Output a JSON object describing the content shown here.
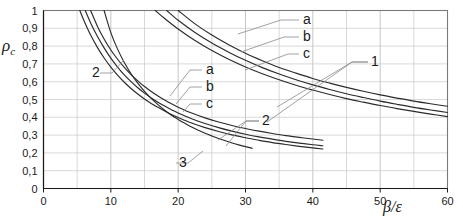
{
  "chart_data": {
    "type": "line",
    "title": "",
    "xlabel": "β/ε",
    "ylabel": "ρ",
    "ylabel_sub": "c",
    "xlim": [
      0,
      60
    ],
    "ylim": [
      0,
      1
    ],
    "grid": true,
    "x_major_step": 10,
    "x_minor_step": 5,
    "y_major_step": 0.1,
    "legend_position": "inline-callouts",
    "xticks": [
      "0",
      "10",
      "20",
      "30",
      "40",
      "50",
      "60"
    ],
    "xtick_values": [
      0,
      10,
      20,
      30,
      40,
      50,
      60
    ],
    "yticks": [
      "0",
      "0,1",
      "0,2",
      "0,3",
      "0,4",
      "0,5",
      "0,6",
      "0,7",
      "0,8",
      "0,9",
      "1"
    ],
    "ytick_values": [
      0,
      0.1,
      0.2,
      0.3,
      0.4,
      0.5,
      0.6,
      0.7,
      0.8,
      0.9,
      1
    ],
    "annotations": [
      {
        "text": "a",
        "x_px": 303,
        "y_px": 24,
        "group": "1"
      },
      {
        "text": "b",
        "x_px": 303,
        "y_px": 41,
        "group": "1"
      },
      {
        "text": "c",
        "x_px": 303,
        "y_px": 58,
        "group": "1"
      },
      {
        "text": "1",
        "x_px": 371,
        "y_px": 66,
        "group": "1"
      },
      {
        "text": "a",
        "x_px": 206,
        "y_px": 74,
        "group": "2"
      },
      {
        "text": "b",
        "x_px": 206,
        "y_px": 91,
        "group": "2"
      },
      {
        "text": "c",
        "x_px": 206,
        "y_px": 108,
        "group": "2"
      },
      {
        "text": "2",
        "x_px": 262,
        "y_px": 125,
        "group": "2"
      },
      {
        "text": "2",
        "x_px": 92,
        "y_px": 77,
        "group": "2"
      },
      {
        "text": "3",
        "x_px": 179,
        "y_px": 167,
        "group": "3"
      }
    ],
    "series": [
      {
        "name": "1a",
        "group": "1",
        "points": [
          [
            20.0,
            1.0
          ],
          [
            22.5,
            0.925
          ],
          [
            25.0,
            0.862
          ],
          [
            27.5,
            0.808
          ],
          [
            30.0,
            0.76
          ],
          [
            32.5,
            0.718
          ],
          [
            35.0,
            0.68
          ],
          [
            37.5,
            0.648
          ],
          [
            40.0,
            0.618
          ],
          [
            42.5,
            0.592
          ],
          [
            45.0,
            0.568
          ],
          [
            47.5,
            0.546
          ],
          [
            50.0,
            0.526
          ],
          [
            52.5,
            0.508
          ],
          [
            55.0,
            0.491
          ],
          [
            57.5,
            0.476
          ],
          [
            60.0,
            0.462
          ]
        ]
      },
      {
        "name": "1b",
        "group": "1",
        "points": [
          [
            18.3,
            1.0
          ],
          [
            20.0,
            0.945
          ],
          [
            22.5,
            0.876
          ],
          [
            25.0,
            0.817
          ],
          [
            27.5,
            0.766
          ],
          [
            30.0,
            0.72
          ],
          [
            32.5,
            0.679
          ],
          [
            35.0,
            0.643
          ],
          [
            37.5,
            0.611
          ],
          [
            40.0,
            0.582
          ],
          [
            42.5,
            0.556
          ],
          [
            45.0,
            0.532
          ],
          [
            47.5,
            0.511
          ],
          [
            50.0,
            0.491
          ],
          [
            52.5,
            0.473
          ],
          [
            55.0,
            0.456
          ],
          [
            57.5,
            0.441
          ],
          [
            60.0,
            0.427
          ]
        ]
      },
      {
        "name": "1c",
        "group": "1",
        "points": [
          [
            16.6,
            1.0
          ],
          [
            18.0,
            0.955
          ],
          [
            20.0,
            0.896
          ],
          [
            22.5,
            0.831
          ],
          [
            25.0,
            0.775
          ],
          [
            27.5,
            0.726
          ],
          [
            30.0,
            0.683
          ],
          [
            32.5,
            0.645
          ],
          [
            35.0,
            0.611
          ],
          [
            37.5,
            0.58
          ],
          [
            40.0,
            0.553
          ],
          [
            42.5,
            0.528
          ],
          [
            45.0,
            0.505
          ],
          [
            47.5,
            0.485
          ],
          [
            50.0,
            0.466
          ],
          [
            52.5,
            0.449
          ],
          [
            55.0,
            0.433
          ],
          [
            57.5,
            0.418
          ],
          [
            60.0,
            0.404
          ]
        ]
      },
      {
        "name": "2a",
        "group": "2",
        "points": [
          [
            7.0,
            1.0
          ],
          [
            8.0,
            0.912
          ],
          [
            9.0,
            0.84
          ],
          [
            10.0,
            0.778
          ],
          [
            11.0,
            0.726
          ],
          [
            12.0,
            0.68
          ],
          [
            13.0,
            0.64
          ],
          [
            14.0,
            0.605
          ],
          [
            15.0,
            0.573
          ],
          [
            16.0,
            0.545
          ],
          [
            17.0,
            0.52
          ],
          [
            18.0,
            0.497
          ],
          [
            19.0,
            0.476
          ],
          [
            20.0,
            0.457
          ],
          [
            22.0,
            0.424
          ],
          [
            24.0,
            0.397
          ],
          [
            26.0,
            0.374
          ],
          [
            28.0,
            0.354
          ],
          [
            30.0,
            0.337
          ],
          [
            32.0,
            0.322
          ],
          [
            34.0,
            0.309
          ],
          [
            36.0,
            0.297
          ],
          [
            38.0,
            0.287
          ],
          [
            40.0,
            0.278
          ],
          [
            41.5,
            0.271
          ]
        ]
      },
      {
        "name": "2b",
        "group": "2",
        "points": [
          [
            6.2,
            1.0
          ],
          [
            7.0,
            0.93
          ],
          [
            8.0,
            0.855
          ],
          [
            9.0,
            0.79
          ],
          [
            10.0,
            0.732
          ],
          [
            11.0,
            0.682
          ],
          [
            12.0,
            0.638
          ],
          [
            13.0,
            0.6
          ],
          [
            14.0,
            0.566
          ],
          [
            15.0,
            0.536
          ],
          [
            16.0,
            0.509
          ],
          [
            17.0,
            0.485
          ],
          [
            18.0,
            0.463
          ],
          [
            19.0,
            0.443
          ],
          [
            20.0,
            0.424
          ],
          [
            22.0,
            0.392
          ],
          [
            24.0,
            0.365
          ],
          [
            26.0,
            0.342
          ],
          [
            28.0,
            0.322
          ],
          [
            30.0,
            0.305
          ],
          [
            32.0,
            0.29
          ],
          [
            34.0,
            0.277
          ],
          [
            36.0,
            0.265
          ],
          [
            38.0,
            0.255
          ],
          [
            40.0,
            0.246
          ],
          [
            41.5,
            0.24
          ]
        ]
      },
      {
        "name": "2c",
        "group": "2",
        "points": [
          [
            5.4,
            1.0
          ],
          [
            6.0,
            0.944
          ],
          [
            7.0,
            0.862
          ],
          [
            8.0,
            0.793
          ],
          [
            9.0,
            0.733
          ],
          [
            10.0,
            0.682
          ],
          [
            11.0,
            0.637
          ],
          [
            12.0,
            0.597
          ],
          [
            13.0,
            0.562
          ],
          [
            14.0,
            0.531
          ],
          [
            15.0,
            0.503
          ],
          [
            16.0,
            0.478
          ],
          [
            17.0,
            0.456
          ],
          [
            18.0,
            0.435
          ],
          [
            19.0,
            0.416
          ],
          [
            20.0,
            0.399
          ],
          [
            22.0,
            0.368
          ],
          [
            24.0,
            0.342
          ],
          [
            26.0,
            0.32
          ],
          [
            28.0,
            0.301
          ],
          [
            30.0,
            0.285
          ],
          [
            32.0,
            0.271
          ],
          [
            34.0,
            0.258
          ],
          [
            36.0,
            0.247
          ],
          [
            38.0,
            0.237
          ],
          [
            40.0,
            0.228
          ],
          [
            41.5,
            0.222
          ]
        ]
      },
      {
        "name": "3",
        "group": "3",
        "points": [
          [
            9.0,
            1.0
          ],
          [
            10.0,
            0.876
          ],
          [
            11.0,
            0.783
          ],
          [
            12.0,
            0.708
          ],
          [
            13.0,
            0.645
          ],
          [
            14.0,
            0.592
          ],
          [
            15.0,
            0.546
          ],
          [
            16.0,
            0.506
          ],
          [
            17.0,
            0.471
          ],
          [
            18.0,
            0.44
          ],
          [
            19.0,
            0.412
          ],
          [
            20.0,
            0.388
          ],
          [
            21.0,
            0.366
          ],
          [
            22.0,
            0.345
          ],
          [
            23.0,
            0.327
          ],
          [
            24.0,
            0.31
          ],
          [
            25.0,
            0.295
          ],
          [
            26.0,
            0.281
          ],
          [
            27.0,
            0.268
          ],
          [
            28.0,
            0.256
          ],
          [
            29.0,
            0.245
          ],
          [
            30.0,
            0.235
          ],
          [
            31.0,
            0.226
          ]
        ]
      }
    ]
  },
  "axes": {
    "y_label_text": "ρ",
    "y_label_sub": "c",
    "x_label_text": "β/ε"
  }
}
